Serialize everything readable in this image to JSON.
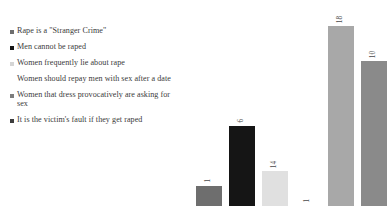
{
  "chart_data": {
    "type": "bar",
    "title": "",
    "xlabel": "",
    "ylabel": "",
    "grid": false,
    "legend_position": "left",
    "ylim": [
      0,
      20
    ],
    "categories": [
      "Rape is a \"Stranger Crime\"",
      "Men cannot be raped",
      "Women frequently lie about rape",
      "Women should repay men with sex after a date",
      "Women that dress provocatively are asking for sex",
      "It is the victim's fault if they get raped"
    ],
    "values": [
      1,
      6,
      14,
      1,
      18,
      10
    ],
    "value_labels": [
      "1",
      "6",
      "14",
      "1",
      "18",
      "10"
    ],
    "colors": [
      "#6e6e6e",
      "#151515",
      "#e0e0e0",
      "#ffffff",
      "#a8a8a8",
      "#8a8a8a"
    ],
    "bar_pixel_heights": [
      20,
      80,
      35,
      0,
      180,
      145
    ]
  },
  "legend": {
    "items": [
      {
        "label": "Rape is a \"Stranger Crime\"",
        "color": "#6e6e6e",
        "marker": "square-marker",
        "visible_marker": true
      },
      {
        "label": "Men cannot be raped",
        "color": "#151515",
        "marker": "square-marker",
        "visible_marker": true
      },
      {
        "label": "Women frequently lie about rape",
        "color": "#d5d5d5",
        "marker": "square-marker",
        "visible_marker": true
      },
      {
        "label": "Women should repay men with sex after a date",
        "color": "#ffffff",
        "marker": "square-marker",
        "visible_marker": false
      },
      {
        "label": "Women that dress provocatively are asking for sex",
        "color": "#7d7d7d",
        "marker": "square-marker",
        "visible_marker": true
      },
      {
        "label": "It is the victim's fault if they get raped",
        "color": "#3d3d3d",
        "marker": "square-marker",
        "visible_marker": true
      }
    ]
  }
}
